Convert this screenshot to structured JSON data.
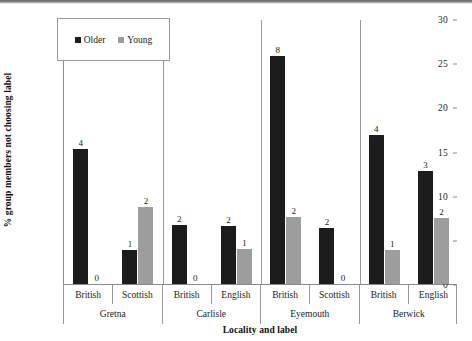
{
  "chart_data": {
    "type": "bar",
    "title": "",
    "xlabel": "Locality and label",
    "ylabel": "% group members not choosing label",
    "ylim": [
      0,
      30
    ],
    "yticks": [
      0,
      5,
      10,
      15,
      20,
      25,
      30
    ],
    "grid": false,
    "legend_position": "top-left",
    "legend": [
      "Older",
      "Young"
    ],
    "group_label_level1": "label",
    "group_label_level2": "locality",
    "categories": [
      "Gretna / British",
      "Gretna / Scottish",
      "Carlisle / British",
      "Carlisle / English",
      "Eyemouth / British",
      "Eyemouth / Scottish",
      "Berwick / British",
      "Berwick / English"
    ],
    "localities": [
      {
        "name": "Gretna",
        "labels": [
          "British",
          "Scottish"
        ]
      },
      {
        "name": "Carlisle",
        "labels": [
          "British",
          "English"
        ]
      },
      {
        "name": "Eyemouth",
        "labels": [
          "British",
          "Scottish"
        ]
      },
      {
        "name": "Berwick",
        "labels": [
          "British",
          "English"
        ]
      }
    ],
    "series": [
      {
        "name": "Older",
        "color": "#1c1c1c",
        "values": [
          15.3,
          3.8,
          6.7,
          6.6,
          25.8,
          6.3,
          16.9,
          12.8
        ],
        "data_labels": [
          "4",
          "1",
          "2",
          "2",
          "8",
          "2",
          "4",
          "3"
        ]
      },
      {
        "name": "Young",
        "color": "#9d9d9d",
        "values": [
          0,
          8.7,
          0,
          4.0,
          7.6,
          0,
          3.8,
          7.5
        ],
        "data_labels": [
          "0",
          "2",
          "0",
          "1",
          "2",
          "0",
          "1",
          "2"
        ]
      }
    ]
  },
  "axes": {
    "y_title": "% group members not choosing label",
    "x_title": "Locality and label",
    "y_tick_labels": [
      "0",
      "5",
      "10",
      "15",
      "20",
      "25",
      "30"
    ]
  },
  "legend": {
    "items": [
      {
        "label": "Older",
        "color": "#1c1c1c"
      },
      {
        "label": "Young",
        "color": "#9d9d9d"
      }
    ]
  }
}
